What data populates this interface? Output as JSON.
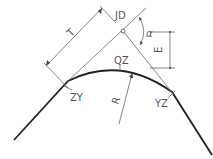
{
  "diagram": {
    "labels": {
      "jd": "JD",
      "qz": "QZ",
      "zy": "ZY",
      "yz": "YZ",
      "t": "T",
      "e": "E",
      "r": "R",
      "alpha": "α"
    },
    "colors": {
      "curve": "#222222",
      "construction": "#666666",
      "text": "#555555"
    }
  }
}
